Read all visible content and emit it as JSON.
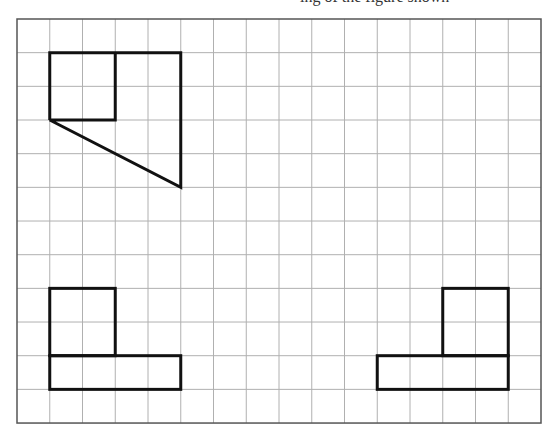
{
  "header": {
    "cut_text": "ing of the figure shown"
  },
  "grid": {
    "origin_x": 17,
    "origin_y": 19,
    "cols": 16,
    "rows": 12,
    "cell_w": 32.75,
    "cell_h": 33.67,
    "line_color": "#b0b0b0",
    "border_color": "#555555"
  },
  "shapes": {
    "stroke_color": "#111111",
    "stroke_width": 3,
    "top_view": [
      {
        "type": "polyline",
        "points": [
          [
            1,
            3
          ],
          [
            1,
            1
          ],
          [
            5,
            1
          ],
          [
            5,
            5
          ],
          [
            1,
            3
          ],
          [
            3,
            3
          ],
          [
            3,
            1
          ]
        ]
      }
    ],
    "front_view": [
      {
        "type": "rect",
        "x": 1,
        "y": 8,
        "w": 2,
        "h": 2
      },
      {
        "type": "rect",
        "x": 1,
        "y": 10,
        "w": 4,
        "h": 1
      }
    ],
    "side_view": [
      {
        "type": "rect",
        "x": 13,
        "y": 8,
        "w": 2,
        "h": 2
      },
      {
        "type": "rect",
        "x": 11,
        "y": 10,
        "w": 4,
        "h": 1
      }
    ]
  }
}
